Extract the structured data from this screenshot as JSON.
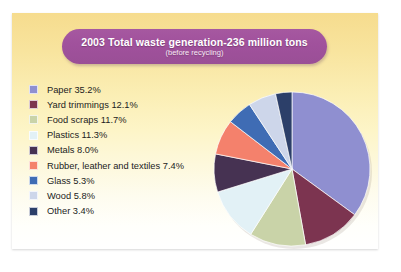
{
  "card": {
    "background_top": "#f6dc8e",
    "background_bottom": "#ffffff"
  },
  "title": {
    "main": "2003 Total waste generation-236 million tons",
    "subtitle": "(before recycling)",
    "banner_color": "#a0519c",
    "text_color": "#ffffff"
  },
  "legend": {
    "items": [
      {
        "label": "Paper 35.2%",
        "color": "#8f8fd0"
      },
      {
        "label": "Yard trimmings 12.1%",
        "color": "#7c3450"
      },
      {
        "label": "Food scraps 11.7%",
        "color": "#c9d3a8"
      },
      {
        "label": "Plastics 11.3%",
        "color": "#e2f1f6"
      },
      {
        "label": "Metals 8.0%",
        "color": "#463252"
      },
      {
        "label": "Rubber, leather and textiles 7.4%",
        "color": "#f4816c"
      },
      {
        "label": "Glass 5.3%",
        "color": "#3f6cb4"
      },
      {
        "label": "Wood 5.8%",
        "color": "#cdd6ea"
      },
      {
        "label": "Other 3.4%",
        "color": "#2c3f69"
      }
    ]
  },
  "chart_data": {
    "type": "pie",
    "title": "2003 Total waste generation-236 million tons",
    "subtitle": "(before recycling)",
    "unit": "percent",
    "total_label": "236 million tons",
    "start_angle_deg": 0,
    "direction": "clockwise",
    "legend_position": "left",
    "categories": [
      "Paper",
      "Yard trimmings",
      "Food scraps",
      "Plastics",
      "Metals",
      "Rubber, leather and textiles",
      "Glass",
      "Wood",
      "Other"
    ],
    "values": [
      35.2,
      12.1,
      11.7,
      11.3,
      8.0,
      7.4,
      5.3,
      5.8,
      3.4
    ],
    "colors": [
      "#8f8fd0",
      "#7c3450",
      "#c9d3a8",
      "#e2f1f6",
      "#463252",
      "#f4816c",
      "#3f6cb4",
      "#cdd6ea",
      "#2c3f69"
    ]
  }
}
